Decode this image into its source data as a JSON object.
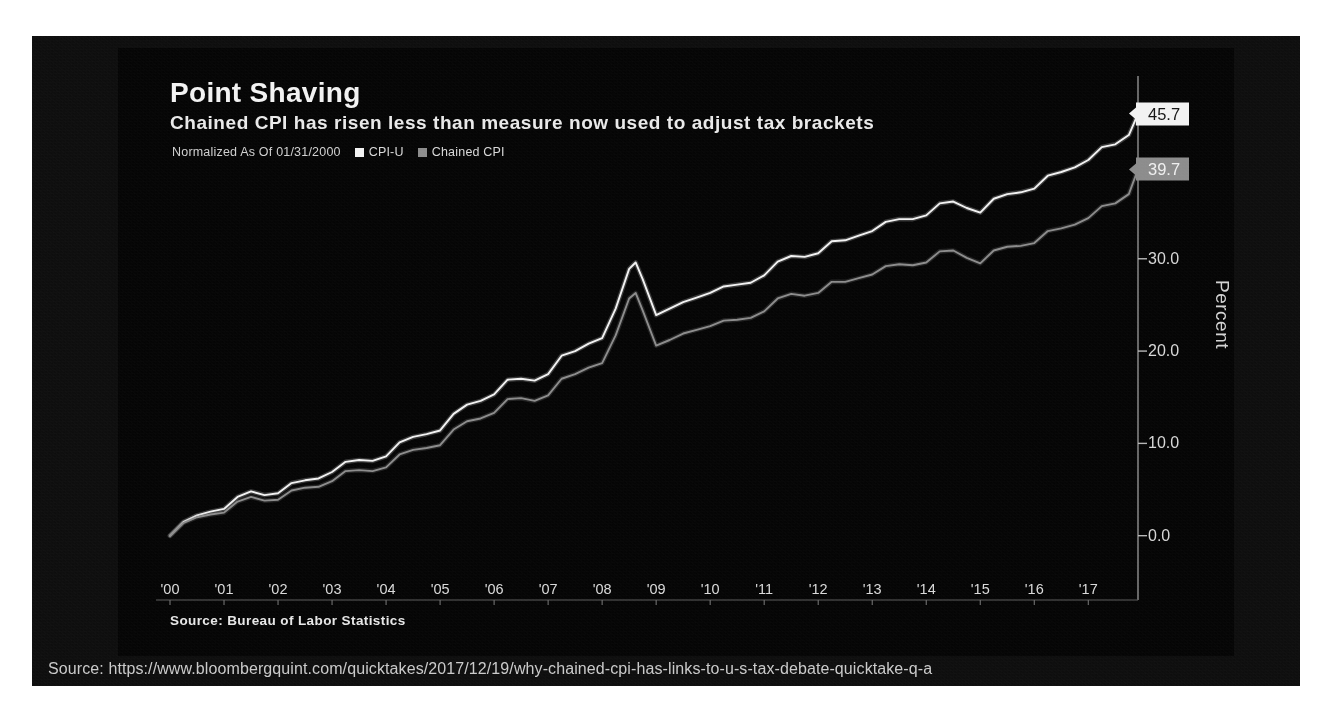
{
  "slide": {
    "url_caption": "Source: https://www.bloombergquint.com/quicktakes/2017/12/19/why-chained-cpi-has-links-to-u-s-tax-debate-quicktake-q-a"
  },
  "header": {
    "title": "Point Shaving",
    "subtitle": "Chained CPI has risen less than measure now used to adjust tax brackets"
  },
  "legend": {
    "normalized_note": "Normalized As Of 01/31/2000",
    "entries": [
      {
        "label": "CPI-U",
        "color": "#f2f2f2"
      },
      {
        "label": "Chained CPI",
        "color": "#8a8a8a"
      }
    ]
  },
  "callouts": [
    {
      "name": "cpi-u",
      "value": "45.7",
      "color": "#f2f2f2"
    },
    {
      "name": "chained-cpi",
      "value": "39.7",
      "color": "#8a8a8a"
    }
  ],
  "footer": {
    "source": "Source: Bureau of Labor Statistics"
  },
  "chart_data": {
    "type": "line",
    "title": "Point Shaving",
    "subtitle": "Chained CPI has risen less than measure now used to adjust tax brackets",
    "xlabel": "",
    "ylabel": "Percent",
    "ylim": [
      -3.5,
      48.5
    ],
    "yticks": [
      0.0,
      10.0,
      20.0,
      30.0
    ],
    "ytick_labels": [
      "0.0",
      "10.0",
      "20.0",
      "30.0"
    ],
    "xlim": [
      2000.0,
      2017.92
    ],
    "xticks": [
      2000,
      2001,
      2002,
      2003,
      2004,
      2005,
      2006,
      2007,
      2008,
      2009,
      2010,
      2011,
      2012,
      2013,
      2014,
      2015,
      2016,
      2017
    ],
    "xtick_labels": [
      "'00",
      "'01",
      "'02",
      "'03",
      "'04",
      "'05",
      "'06",
      "'07",
      "'08",
      "'09",
      "'10",
      "'11",
      "'12",
      "'13",
      "'14",
      "'15",
      "'16",
      "'17"
    ],
    "grid": false,
    "legend_position": "top-left",
    "axis_side": "right",
    "note": "Both indexes normalized to 0 at 01/31/2000; values are cumulative percent change.",
    "series": [
      {
        "name": "CPI-U",
        "color": "#f2f2f2",
        "end_value": 45.7,
        "x": [
          2000.0,
          2000.25,
          2000.5,
          2000.75,
          2001.0,
          2001.25,
          2001.5,
          2001.75,
          2002.0,
          2002.25,
          2002.5,
          2002.75,
          2003.0,
          2003.25,
          2003.5,
          2003.75,
          2004.0,
          2004.25,
          2004.5,
          2004.75,
          2005.0,
          2005.25,
          2005.5,
          2005.75,
          2006.0,
          2006.25,
          2006.5,
          2006.75,
          2007.0,
          2007.25,
          2007.5,
          2007.75,
          2008.0,
          2008.25,
          2008.5,
          2008.62,
          2008.75,
          2009.0,
          2009.25,
          2009.5,
          2009.75,
          2010.0,
          2010.25,
          2010.5,
          2010.75,
          2011.0,
          2011.25,
          2011.5,
          2011.75,
          2012.0,
          2012.25,
          2012.5,
          2012.75,
          2013.0,
          2013.25,
          2013.5,
          2013.75,
          2014.0,
          2014.25,
          2014.5,
          2014.75,
          2015.0,
          2015.25,
          2015.5,
          2015.75,
          2016.0,
          2016.25,
          2016.5,
          2016.75,
          2017.0,
          2017.25,
          2017.5,
          2017.75,
          2017.92
        ],
        "y": [
          0.0,
          1.5,
          2.2,
          2.6,
          2.9,
          4.2,
          4.8,
          4.4,
          4.6,
          5.7,
          6.0,
          6.2,
          6.9,
          8.0,
          8.2,
          8.1,
          8.6,
          10.1,
          10.7,
          11.0,
          11.4,
          13.2,
          14.2,
          14.6,
          15.3,
          16.9,
          17.0,
          16.8,
          17.5,
          19.5,
          20.0,
          20.8,
          21.4,
          24.6,
          28.9,
          29.6,
          27.8,
          23.9,
          24.6,
          25.3,
          25.8,
          26.3,
          27.0,
          27.2,
          27.4,
          28.2,
          29.7,
          30.3,
          30.2,
          30.6,
          31.9,
          32.0,
          32.5,
          33.0,
          34.0,
          34.3,
          34.3,
          34.7,
          36.0,
          36.2,
          35.5,
          35.0,
          36.5,
          37.0,
          37.2,
          37.6,
          39.0,
          39.4,
          39.9,
          40.7,
          42.1,
          42.4,
          43.4,
          45.7
        ]
      },
      {
        "name": "Chained CPI",
        "color": "#8a8a8a",
        "end_value": 39.7,
        "x": [
          2000.0,
          2000.25,
          2000.5,
          2000.75,
          2001.0,
          2001.25,
          2001.5,
          2001.75,
          2002.0,
          2002.25,
          2002.5,
          2002.75,
          2003.0,
          2003.25,
          2003.5,
          2003.75,
          2004.0,
          2004.25,
          2004.5,
          2004.75,
          2005.0,
          2005.25,
          2005.5,
          2005.75,
          2006.0,
          2006.25,
          2006.5,
          2006.75,
          2007.0,
          2007.25,
          2007.5,
          2007.75,
          2008.0,
          2008.25,
          2008.5,
          2008.62,
          2008.75,
          2009.0,
          2009.25,
          2009.5,
          2009.75,
          2010.0,
          2010.25,
          2010.5,
          2010.75,
          2011.0,
          2011.25,
          2011.5,
          2011.75,
          2012.0,
          2012.25,
          2012.5,
          2012.75,
          2013.0,
          2013.25,
          2013.5,
          2013.75,
          2014.0,
          2014.25,
          2014.5,
          2014.75,
          2015.0,
          2015.25,
          2015.5,
          2015.75,
          2016.0,
          2016.25,
          2016.5,
          2016.75,
          2017.0,
          2017.25,
          2017.5,
          2017.75,
          2017.92
        ],
        "y": [
          0.0,
          1.4,
          2.0,
          2.3,
          2.5,
          3.7,
          4.2,
          3.8,
          3.9,
          4.9,
          5.2,
          5.3,
          5.9,
          7.0,
          7.1,
          7.0,
          7.4,
          8.8,
          9.3,
          9.5,
          9.8,
          11.5,
          12.4,
          12.7,
          13.3,
          14.8,
          14.9,
          14.6,
          15.2,
          17.0,
          17.5,
          18.2,
          18.7,
          21.7,
          25.7,
          26.3,
          24.4,
          20.6,
          21.2,
          21.9,
          22.3,
          22.7,
          23.3,
          23.4,
          23.6,
          24.3,
          25.7,
          26.2,
          26.0,
          26.3,
          27.5,
          27.5,
          27.9,
          28.3,
          29.2,
          29.4,
          29.3,
          29.6,
          30.8,
          30.9,
          30.1,
          29.5,
          30.9,
          31.3,
          31.4,
          31.7,
          33.0,
          33.3,
          33.7,
          34.4,
          35.7,
          36.0,
          37.0,
          39.7
        ]
      }
    ]
  }
}
